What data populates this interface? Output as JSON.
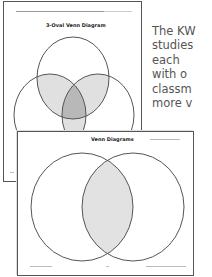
{
  "back_page": {
    "title": "3-Oval Venn Diagram",
    "header_note": "",
    "fill_light": "#e0e0e0",
    "fill_dark": "#b8b8b8",
    "stroke": "#555555"
  },
  "front_page": {
    "title": "Venn Diagrams",
    "fill": "#e2e2e2",
    "stroke": "#555555"
  },
  "description": {
    "lines": [
      "The KW",
      "studies",
      "each",
      "with o",
      "classm",
      "more v"
    ]
  }
}
